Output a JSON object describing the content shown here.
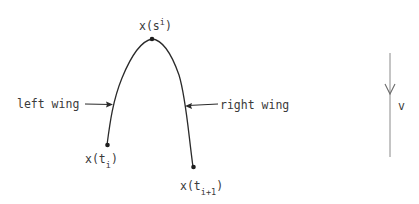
{
  "diagram": {
    "curve": {
      "peak_label": {
        "base": "x(s",
        "sup": "i",
        "close": ")"
      },
      "left_end_label": {
        "base": "x(t",
        "sub": "i",
        "close": ")"
      },
      "right_end_label": {
        "base": "x(t",
        "sub": "i+1",
        "close": ")"
      }
    },
    "annotations": {
      "left_wing": "left wing",
      "right_wing": "right wing"
    },
    "direction_vector": {
      "label": "v"
    },
    "colors": {
      "ink": "#2a2a2a",
      "text": "#3a3a3a",
      "vector": "#8a8a8a"
    }
  }
}
